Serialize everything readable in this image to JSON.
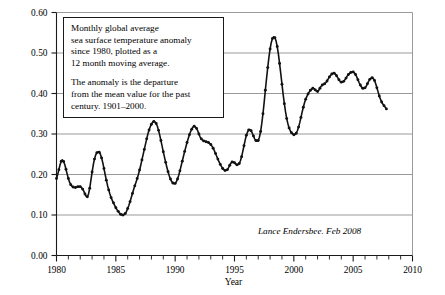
{
  "annotation": {
    "line1": "Monthly global average",
    "line2": "sea surface temperature anomaly",
    "line3": "since 1980, plotted as a",
    "line4": "12 month moving average.",
    "line5": "The anomaly is the departure",
    "line6": "from the mean value for the past",
    "line7": "century. 1901–2000."
  },
  "credit": "Lance Endersbee. Feb 2008",
  "colors": {
    "axis": "#1a1a1a",
    "grid": "#9a9a9a",
    "series": "#111111",
    "background": "#ffffff"
  },
  "chart_data": {
    "type": "line",
    "title": "",
    "subtitle": "",
    "xlabel": "Year",
    "ylabel": "Global Average Sea Surface Temperature Anomaly : deg C",
    "xlim": [
      1980,
      2010
    ],
    "ylim": [
      0.0,
      0.6
    ],
    "xticks": [
      1980,
      1985,
      1990,
      1995,
      2000,
      2005,
      2010
    ],
    "xtick_labels": [
      "1980",
      "1985",
      "1990",
      "1995",
      "2000",
      "2005",
      "2010"
    ],
    "xminor_interval": 1,
    "yticks": [
      0.0,
      0.1,
      0.2,
      0.3,
      0.4,
      0.5,
      0.6
    ],
    "ytick_labels": [
      "0.00",
      "0.10",
      "0.20",
      "0.30",
      "0.40",
      "0.50",
      "0.60"
    ],
    "grid": "horizontal",
    "legend": "none",
    "marker": "filled-circle",
    "series": [
      {
        "name": "Monthly global average sea surface temperature anomaly (12 month moving average)",
        "x": [
          1980.0,
          1980.1,
          1980.2,
          1980.3,
          1980.4,
          1980.5,
          1980.6,
          1980.7,
          1980.8,
          1980.9,
          1981.0,
          1981.1,
          1981.2,
          1981.3,
          1981.4,
          1981.5,
          1981.6,
          1981.7,
          1981.8,
          1981.9,
          1982.0,
          1982.1,
          1982.2,
          1982.3,
          1982.4,
          1982.5,
          1982.6,
          1982.7,
          1982.8,
          1982.9,
          1983.0,
          1983.1,
          1983.2,
          1983.3,
          1983.4,
          1983.5,
          1983.6,
          1983.7,
          1983.8,
          1983.9,
          1984.0,
          1984.1,
          1984.2,
          1984.3,
          1984.4,
          1984.5,
          1984.6,
          1984.7,
          1984.8,
          1984.9,
          1985.0,
          1985.1,
          1985.2,
          1985.3,
          1985.4,
          1985.5,
          1985.6,
          1985.7,
          1985.8,
          1985.9,
          1986.0,
          1986.1,
          1986.2,
          1986.3,
          1986.4,
          1986.5,
          1986.6,
          1986.7,
          1986.8,
          1986.9,
          1987.0,
          1987.1,
          1987.2,
          1987.3,
          1987.4,
          1987.5,
          1987.6,
          1987.7,
          1987.8,
          1987.9,
          1988.0,
          1988.1,
          1988.2,
          1988.3,
          1988.4,
          1988.5,
          1988.6,
          1988.7,
          1988.8,
          1988.9,
          1989.0,
          1989.1,
          1989.2,
          1989.3,
          1989.4,
          1989.5,
          1989.6,
          1989.7,
          1989.8,
          1989.9,
          1990.0,
          1990.1,
          1990.2,
          1990.3,
          1990.4,
          1990.5,
          1990.6,
          1990.7,
          1990.8,
          1990.9,
          1991.0,
          1991.1,
          1991.2,
          1991.3,
          1991.4,
          1991.5,
          1991.6,
          1991.7,
          1991.8,
          1991.9,
          1992.0,
          1992.1,
          1992.2,
          1992.3,
          1992.4,
          1992.5,
          1992.6,
          1992.7,
          1992.8,
          1992.9,
          1993.0,
          1993.1,
          1993.2,
          1993.3,
          1993.4,
          1993.5,
          1993.6,
          1993.7,
          1993.8,
          1993.9,
          1994.0,
          1994.1,
          1994.2,
          1994.3,
          1994.4,
          1994.5,
          1994.6,
          1994.7,
          1994.8,
          1994.9,
          1995.0,
          1995.1,
          1995.2,
          1995.3,
          1995.4,
          1995.5,
          1995.6,
          1995.7,
          1995.8,
          1995.9,
          1996.0,
          1996.1,
          1996.2,
          1996.3,
          1996.4,
          1996.5,
          1996.6,
          1996.7,
          1996.8,
          1996.9,
          1997.0,
          1997.1,
          1997.2,
          1997.3,
          1997.4,
          1997.5,
          1997.6,
          1997.7,
          1997.8,
          1997.9,
          1998.0,
          1998.1,
          1998.2,
          1998.3,
          1998.4,
          1998.5,
          1998.6,
          1998.7,
          1998.8,
          1998.9,
          1999.0,
          1999.1,
          1999.2,
          1999.3,
          1999.4,
          1999.5,
          1999.6,
          1999.7,
          1999.8,
          1999.9,
          2000.0,
          2000.1,
          2000.2,
          2000.3,
          2000.4,
          2000.5,
          2000.6,
          2000.7,
          2000.8,
          2000.9,
          2001.0,
          2001.1,
          2001.2,
          2001.3,
          2001.4,
          2001.5,
          2001.6,
          2001.7,
          2001.8,
          2001.9,
          2002.0,
          2002.1,
          2002.2,
          2002.3,
          2002.4,
          2002.5,
          2002.6,
          2002.7,
          2002.8,
          2002.9,
          2003.0,
          2003.1,
          2003.2,
          2003.3,
          2003.4,
          2003.5,
          2003.6,
          2003.7,
          2003.8,
          2003.9,
          2004.0,
          2004.1,
          2004.2,
          2004.3,
          2004.4,
          2004.5,
          2004.6,
          2004.7,
          2004.8,
          2004.9,
          2005.0,
          2005.1,
          2005.2,
          2005.3,
          2005.4,
          2005.5,
          2005.6,
          2005.7,
          2005.8,
          2005.9,
          2006.0,
          2006.1,
          2006.2,
          2006.3,
          2006.4,
          2006.5,
          2006.6,
          2006.7,
          2006.8,
          2006.9,
          2007.0,
          2007.1,
          2007.2,
          2007.3,
          2007.4,
          2007.5,
          2007.6,
          2007.7,
          2007.8
        ],
        "y": [
          0.19,
          0.2,
          0.212,
          0.224,
          0.233,
          0.236,
          0.232,
          0.224,
          0.213,
          0.201,
          0.19,
          0.181,
          0.175,
          0.171,
          0.169,
          0.168,
          0.168,
          0.169,
          0.17,
          0.17,
          0.17,
          0.168,
          0.164,
          0.159,
          0.152,
          0.146,
          0.145,
          0.152,
          0.166,
          0.186,
          0.206,
          0.224,
          0.238,
          0.248,
          0.254,
          0.256,
          0.255,
          0.25,
          0.241,
          0.229,
          0.215,
          0.2,
          0.186,
          0.173,
          0.162,
          0.152,
          0.143,
          0.136,
          0.13,
          0.124,
          0.118,
          0.113,
          0.109,
          0.105,
          0.102,
          0.1,
          0.1,
          0.101,
          0.104,
          0.109,
          0.116,
          0.124,
          0.133,
          0.143,
          0.153,
          0.163,
          0.172,
          0.181,
          0.19,
          0.2,
          0.211,
          0.223,
          0.236,
          0.249,
          0.262,
          0.275,
          0.288,
          0.3,
          0.31,
          0.318,
          0.324,
          0.329,
          0.331,
          0.33,
          0.326,
          0.319,
          0.309,
          0.297,
          0.284,
          0.27,
          0.256,
          0.243,
          0.23,
          0.218,
          0.207,
          0.197,
          0.189,
          0.183,
          0.179,
          0.177,
          0.178,
          0.182,
          0.189,
          0.198,
          0.209,
          0.221,
          0.233,
          0.245,
          0.257,
          0.268,
          0.279,
          0.289,
          0.298,
          0.306,
          0.312,
          0.317,
          0.319,
          0.318,
          0.314,
          0.308,
          0.3,
          0.293,
          0.288,
          0.285,
          0.283,
          0.282,
          0.281,
          0.28,
          0.279,
          0.277,
          0.274,
          0.27,
          0.265,
          0.259,
          0.252,
          0.245,
          0.238,
          0.231,
          0.225,
          0.22,
          0.215,
          0.212,
          0.21,
          0.21,
          0.212,
          0.217,
          0.223,
          0.228,
          0.231,
          0.231,
          0.229,
          0.226,
          0.224,
          0.224,
          0.227,
          0.234,
          0.244,
          0.257,
          0.271,
          0.285,
          0.297,
          0.305,
          0.31,
          0.311,
          0.308,
          0.302,
          0.295,
          0.288,
          0.284,
          0.282,
          0.284,
          0.292,
          0.306,
          0.326,
          0.35,
          0.378,
          0.408,
          0.437,
          0.464,
          0.489,
          0.51,
          0.526,
          0.536,
          0.54,
          0.538,
          0.53,
          0.516,
          0.497,
          0.474,
          0.449,
          0.423,
          0.398,
          0.375,
          0.355,
          0.338,
          0.325,
          0.315,
          0.308,
          0.303,
          0.3,
          0.298,
          0.299,
          0.302,
          0.308,
          0.317,
          0.328,
          0.341,
          0.354,
          0.366,
          0.377,
          0.386,
          0.393,
          0.399,
          0.404,
          0.408,
          0.411,
          0.413,
          0.412,
          0.409,
          0.406,
          0.405,
          0.408,
          0.413,
          0.418,
          0.421,
          0.423,
          0.424,
          0.427,
          0.431,
          0.436,
          0.441,
          0.445,
          0.448,
          0.45,
          0.45,
          0.448,
          0.444,
          0.439,
          0.434,
          0.43,
          0.428,
          0.428,
          0.43,
          0.434,
          0.438,
          0.443,
          0.447,
          0.45,
          0.452,
          0.453,
          0.453,
          0.451,
          0.447,
          0.441,
          0.434,
          0.427,
          0.421,
          0.416,
          0.413,
          0.412,
          0.414,
          0.418,
          0.424,
          0.43,
          0.435,
          0.438,
          0.439,
          0.437,
          0.432,
          0.424,
          0.414,
          0.404,
          0.394,
          0.386,
          0.379,
          0.374,
          0.37,
          0.366,
          0.362
        ]
      }
    ]
  }
}
